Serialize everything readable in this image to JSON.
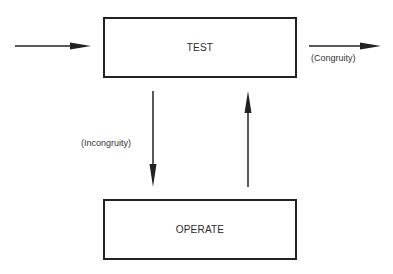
{
  "diagram": {
    "type": "TOTE feedback loop",
    "nodes": [
      {
        "id": "test",
        "label": "TEST"
      },
      {
        "id": "operate",
        "label": "OPERATE"
      }
    ],
    "edges": [
      {
        "from": "input",
        "to": "test",
        "label": ""
      },
      {
        "from": "test",
        "to": "output",
        "label": "(Congruity)"
      },
      {
        "from": "test",
        "to": "operate",
        "label": "(Incongruity)"
      },
      {
        "from": "operate",
        "to": "test",
        "label": ""
      }
    ],
    "labels": {
      "test": "TEST",
      "operate": "OPERATE",
      "congruity": "(Congruity)",
      "incongruity": "(Incongruity)"
    },
    "colors": {
      "stroke": "#222222",
      "background": "#ffffff"
    }
  }
}
